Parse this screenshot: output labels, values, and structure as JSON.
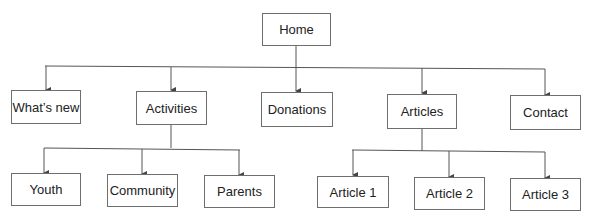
{
  "diagram": {
    "type": "site-map-tree",
    "root": {
      "id": "home",
      "label": "Home"
    },
    "level2": [
      {
        "id": "whats-new",
        "label": "What’s new"
      },
      {
        "id": "activities",
        "label": "Activities"
      },
      {
        "id": "donations",
        "label": "Donations"
      },
      {
        "id": "articles",
        "label": "Articles"
      },
      {
        "id": "contact",
        "label": "Contact"
      }
    ],
    "activities_children": [
      {
        "id": "youth",
        "label": "Youth"
      },
      {
        "id": "community",
        "label": "Community"
      },
      {
        "id": "parents",
        "label": "Parents"
      }
    ],
    "articles_children": [
      {
        "id": "article-1",
        "label": "Article 1"
      },
      {
        "id": "article-2",
        "label": "Article 2"
      },
      {
        "id": "article-3",
        "label": "Article 3"
      }
    ],
    "edges": [
      [
        "home",
        "whats-new"
      ],
      [
        "home",
        "activities"
      ],
      [
        "home",
        "donations"
      ],
      [
        "home",
        "articles"
      ],
      [
        "home",
        "contact"
      ],
      [
        "activities",
        "youth"
      ],
      [
        "activities",
        "community"
      ],
      [
        "activities",
        "parents"
      ],
      [
        "articles",
        "article-1"
      ],
      [
        "articles",
        "article-2"
      ],
      [
        "articles",
        "article-3"
      ]
    ],
    "colors": {
      "line": "#555555",
      "box_border": "#6e6e6e",
      "text": "#222222"
    }
  }
}
